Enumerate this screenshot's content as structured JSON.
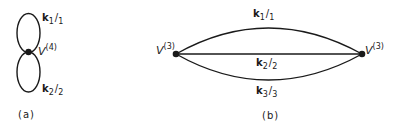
{
  "diagram": {
    "panel_a": {
      "caption": "(a)",
      "vertex": {
        "symbol": "V",
        "order": "(4)"
      },
      "loops": [
        {
          "momentum": "k",
          "index": "1",
          "slash_index": "1"
        },
        {
          "momentum": "k",
          "index": "2",
          "slash_index": "2"
        }
      ]
    },
    "panel_b": {
      "caption": "(b)",
      "left_vertex": {
        "symbol": "V",
        "order": "(3)"
      },
      "right_vertex": {
        "symbol": "V",
        "order": "(3)"
      },
      "propagators": [
        {
          "momentum": "k",
          "index": "1",
          "slash_index": "1"
        },
        {
          "momentum": "k",
          "index": "2",
          "slash_index": "2"
        },
        {
          "momentum": "k",
          "index": "3",
          "slash_index": "3"
        }
      ]
    },
    "colors": {
      "line": "#1a1a1a",
      "background": "#ffffff"
    }
  }
}
